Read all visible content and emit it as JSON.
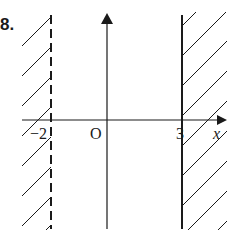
{
  "problem_number": "8.",
  "axes": {
    "origin_label": "O",
    "x_axis_label": "x"
  },
  "boundaries": [
    {
      "value": -2,
      "label": "−2",
      "style": "dashed",
      "shaded_side": "left"
    },
    {
      "value": 3,
      "label": "3",
      "style": "solid",
      "shaded_side": "right"
    }
  ],
  "colors": {
    "ink": "#1a1a1a",
    "background": "#ffffff"
  }
}
